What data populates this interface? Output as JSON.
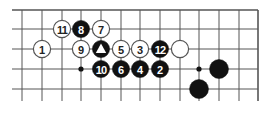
{
  "diagram": {
    "type": "go-board-fragment",
    "grid": {
      "columns_x": [
        22,
        42,
        62,
        81,
        101,
        121,
        140,
        160,
        180,
        199,
        219,
        239,
        258
      ],
      "rows_y": [
        10,
        29,
        49,
        69,
        89
      ],
      "h_line_start_x": 12,
      "v_line_end_y": 101,
      "top_edge": true,
      "right_edge": true,
      "line_color": "#555555"
    },
    "star_points": [
      {
        "col": 3,
        "row": 3
      },
      {
        "col": 9,
        "row": 3
      }
    ],
    "stones": [
      {
        "color": "white",
        "col": 1,
        "row": 2,
        "label": "1"
      },
      {
        "color": "black",
        "col": 7,
        "row": 3,
        "label": "2"
      },
      {
        "color": "white",
        "col": 6,
        "row": 2,
        "label": "3"
      },
      {
        "color": "black",
        "col": 6,
        "row": 3,
        "label": "4"
      },
      {
        "color": "white",
        "col": 5,
        "row": 2,
        "label": "5"
      },
      {
        "color": "black",
        "col": 5,
        "row": 3,
        "label": "6"
      },
      {
        "color": "white",
        "col": 4,
        "row": 1,
        "label": "7"
      },
      {
        "color": "black",
        "col": 3,
        "row": 1,
        "label": "8"
      },
      {
        "color": "white",
        "col": 3,
        "row": 2,
        "label": "9"
      },
      {
        "color": "black",
        "col": 4,
        "row": 3,
        "label": "10"
      },
      {
        "color": "white",
        "col": 2,
        "row": 1,
        "label": "11"
      },
      {
        "color": "black",
        "col": 7,
        "row": 2,
        "label": "12"
      },
      {
        "color": "black",
        "col": 4,
        "row": 2,
        "label": "",
        "marker": "triangle"
      },
      {
        "color": "white",
        "col": 8,
        "row": 2,
        "label": ""
      },
      {
        "color": "black",
        "col": 10,
        "row": 3,
        "label": ""
      },
      {
        "color": "black",
        "col": 9,
        "row": 4,
        "label": ""
      }
    ],
    "colors": {
      "black_stone": "#111111",
      "white_stone": "#ffffff",
      "white_outline": "#555555"
    }
  }
}
